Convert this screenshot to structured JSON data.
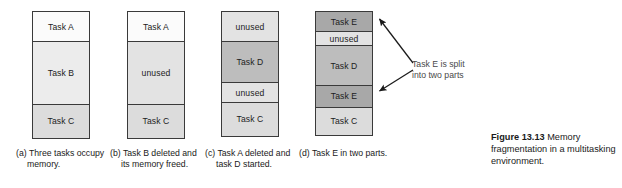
{
  "figure": {
    "label": "Figure 13.13",
    "caption": "Memory fragmentation in a multitasking environment.",
    "full_caption": "Figure 13.13  Memory fragmentation in a multitasking environment."
  },
  "annotation": {
    "text": "Task E is split into two parts",
    "line1": "Task E is split",
    "line2": "into two parts",
    "arrow_count": 2,
    "color": "#4a4a4a"
  },
  "colors": {
    "outline": "#3a3a3a",
    "fill_white": "#fbfbfb",
    "fill_light": "#ececec",
    "fill_light2": "#e3e3e3",
    "fill_mid": "#dcdcdc",
    "fill_medium_gray": "#bdbdbd",
    "fill_dark_gray": "#a8a8a8"
  },
  "panels": [
    {
      "id": "a",
      "marker": "(a)",
      "caption": "Three tasks occupy memory.",
      "caption_lines": [
        "Three tasks",
        "occupy memory."
      ],
      "blocks": [
        {
          "label": "Task A",
          "fill": "fill-white",
          "height": 32
        },
        {
          "label": "Task B",
          "fill": "fill-light",
          "height": 64
        },
        {
          "label": "Task C",
          "fill": "fill-mid",
          "height": 35
        }
      ]
    },
    {
      "id": "b",
      "marker": "(b)",
      "caption": "Task B deleted and its memory freed.",
      "caption_lines": [
        "Task B deleted",
        "and its",
        "memory freed."
      ],
      "blocks": [
        {
          "label": "Task A",
          "fill": "fill-white",
          "height": 32
        },
        {
          "label": "unused",
          "fill": "fill-lt2",
          "height": 64
        },
        {
          "label": "Task C",
          "fill": "fill-mid",
          "height": 35
        }
      ]
    },
    {
      "id": "c",
      "marker": "(c)",
      "caption": "Task A deleted and task D started.",
      "caption_lines": [
        "Task A deleted",
        "and task D",
        "started."
      ],
      "blocks": [
        {
          "label": "unused",
          "fill": "fill-lt2",
          "height": 32
        },
        {
          "label": "Task D",
          "fill": "fill-med",
          "height": 42
        },
        {
          "label": "unused",
          "fill": "fill-lt2",
          "height": 22
        },
        {
          "label": "Task C",
          "fill": "fill-mid",
          "height": 35
        }
      ]
    },
    {
      "id": "d",
      "marker": "(d)",
      "caption": "Task E in two parts.",
      "caption_lines": [
        "Task E in two",
        "parts."
      ],
      "blocks": [
        {
          "label": "Task E",
          "fill": "fill-dark",
          "height": 22
        },
        {
          "label": "unused",
          "fill": "fill-lt2",
          "height": 15
        },
        {
          "label": "Task D",
          "fill": "fill-med",
          "height": 42
        },
        {
          "label": "Task E",
          "fill": "fill-dark",
          "height": 23
        },
        {
          "label": "Task C",
          "fill": "fill-mid",
          "height": 29
        }
      ]
    }
  ]
}
